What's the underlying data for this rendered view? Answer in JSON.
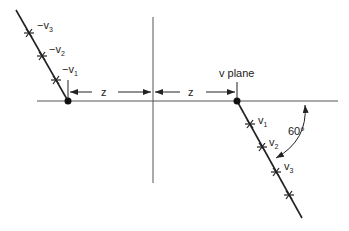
{
  "diagram": {
    "labels": {
      "plane": "v plane",
      "dim_left": "z",
      "dim_right": "z",
      "angle": "60°",
      "neg_prefix": "−v",
      "pos_prefix": "v",
      "sub1": "1",
      "sub2": "2",
      "sub3": "3"
    },
    "angle_degrees": 60,
    "colors": {
      "line": "#222222",
      "axis": "#555555",
      "background": "#ffffff"
    }
  }
}
